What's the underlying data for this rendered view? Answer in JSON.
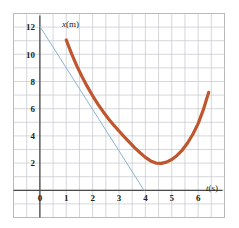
{
  "figure": {
    "background_color": "#ffffff",
    "border_color": "#b9b9b9",
    "grid_color": "#c3c6cb",
    "axis_color": "#4a4a4a",
    "curve_color": "#c0562e",
    "tangent_color": "#8cb4d2"
  },
  "chart_data": {
    "type": "line",
    "title": "",
    "subtitle": "",
    "xlabel": "t(s)",
    "ylabel": "x(m)",
    "xlabel_var": "t",
    "xlabel_unit": "(s)",
    "ylabel_var": "x",
    "ylabel_unit": "(m)",
    "xlim": [
      -1,
      7
    ],
    "ylim": [
      -2,
      13
    ],
    "xticks": [
      0,
      1,
      2,
      3,
      4,
      5,
      6
    ],
    "xtick_labels": [
      "0",
      "1",
      "2",
      "3",
      "4",
      "5",
      "6"
    ],
    "yticks": [
      2,
      4,
      6,
      8,
      10,
      12
    ],
    "ytick_labels": [
      "2",
      "4",
      "6",
      "8",
      "10",
      "12"
    ],
    "grid": true,
    "grid_minor_step": 0.5,
    "legend": false,
    "legend_position": "none",
    "series": [
      {
        "name": "position-curve",
        "type": "line",
        "color": "#c0562e",
        "width": 3.2,
        "points": [
          [
            1.0,
            11.05
          ],
          [
            1.2,
            10.05
          ],
          [
            1.4,
            9.15
          ],
          [
            1.6,
            8.35
          ],
          [
            1.8,
            7.62
          ],
          [
            2.0,
            6.95
          ],
          [
            2.2,
            6.34
          ],
          [
            2.4,
            5.78
          ],
          [
            2.6,
            5.26
          ],
          [
            2.8,
            4.79
          ],
          [
            3.0,
            4.36
          ],
          [
            3.2,
            3.93
          ],
          [
            3.4,
            3.52
          ],
          [
            3.6,
            3.12
          ],
          [
            3.8,
            2.76
          ],
          [
            4.0,
            2.42
          ],
          [
            4.2,
            2.16
          ],
          [
            4.4,
            2.0
          ],
          [
            4.6,
            1.98
          ],
          [
            4.8,
            2.07
          ],
          [
            5.0,
            2.26
          ],
          [
            5.2,
            2.56
          ],
          [
            5.4,
            2.96
          ],
          [
            5.6,
            3.48
          ],
          [
            5.8,
            4.12
          ],
          [
            6.0,
            4.9
          ],
          [
            6.2,
            5.94
          ],
          [
            6.4,
            7.2
          ]
        ]
      },
      {
        "name": "tangent-line",
        "type": "line",
        "color": "#8cb4d2",
        "width": 1,
        "points": [
          [
            0.0,
            12.05
          ],
          [
            3.95,
            0.0
          ]
        ]
      }
    ],
    "annotations": []
  }
}
